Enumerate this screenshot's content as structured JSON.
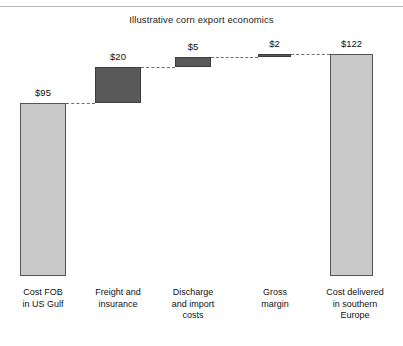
{
  "chart_data": {
    "type": "bar",
    "subtype": "waterfall",
    "title": "Illustrative corn export economics",
    "xlabel": "",
    "ylabel": "",
    "currency": "$",
    "ylim": [
      0,
      130
    ],
    "grid": false,
    "legend": null,
    "categories": [
      "Cost FOB\nin US Gulf",
      "Freight and\ninsurance",
      "Discharge\nand import\ncosts",
      "Gross\nmargin",
      "Cost delivered\nin southern\nEurope"
    ],
    "values": [
      95,
      20,
      5,
      2,
      122
    ],
    "data_labels": [
      "$95",
      "$20",
      "$5",
      "$2",
      "$122"
    ],
    "bar_kinds": [
      "total",
      "delta",
      "delta",
      "delta",
      "total"
    ],
    "cumulative_base": [
      0,
      95,
      115,
      120,
      0
    ],
    "cumulative_top": [
      95,
      115,
      120,
      122,
      122
    ],
    "colors": {
      "total_fill": "#c9c9c9",
      "total_stroke": "#555555",
      "delta_fill": "#595959",
      "delta_stroke": "#3d3d3d",
      "connector": "#6f6f6f",
      "text": "#111111",
      "rule": "#b9b9b9",
      "background": "#ffffff"
    },
    "connectors": [
      {
        "from": 0,
        "to": 1,
        "at_value": 95
      },
      {
        "from": 1,
        "to": 2,
        "at_value": 115
      },
      {
        "from": 2,
        "to": 3,
        "at_value": 120
      },
      {
        "from": 3,
        "to": 4,
        "at_value": 122
      }
    ]
  }
}
